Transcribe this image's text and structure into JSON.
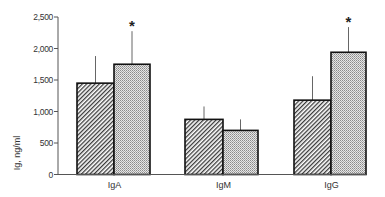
{
  "chart_data": {
    "type": "bar",
    "title": "",
    "xlabel": "",
    "ylabel": "Ig, ng/ml",
    "ylim": [
      0,
      2500
    ],
    "yticks": [
      0,
      500,
      1000,
      1500,
      2000,
      2500
    ],
    "ytick_labels": [
      "0",
      "500",
      "1,000",
      "1,500",
      "2,000",
      "2,500"
    ],
    "categories": [
      "IgA",
      "IgM",
      "IgG"
    ],
    "grid": false,
    "legend": null,
    "series": [
      {
        "name": "Group 1 (hatched)",
        "pattern": "diagonal-hatch",
        "values": [
          1450,
          875,
          1180
        ],
        "error_upper": [
          1880,
          1080,
          1560
        ],
        "significant": [
          false,
          false,
          false
        ]
      },
      {
        "name": "Group 2 (stippled)",
        "pattern": "stipple",
        "values": [
          1750,
          700,
          1940
        ],
        "error_upper": [
          2275,
          875,
          2340
        ],
        "significant": [
          true,
          false,
          true
        ]
      }
    ],
    "annotations": [
      {
        "text": "*",
        "category": "IgA",
        "series": 1
      },
      {
        "text": "*",
        "category": "IgG",
        "series": 1
      }
    ]
  },
  "labels": {
    "ylabel": "Ig, ng/ml",
    "significance_marker": "*"
  },
  "colors": {
    "axis": "#555555",
    "bar_outline": "#111111",
    "hatch": "#333333",
    "stipple": "#888888",
    "error_bar": "#666666"
  }
}
